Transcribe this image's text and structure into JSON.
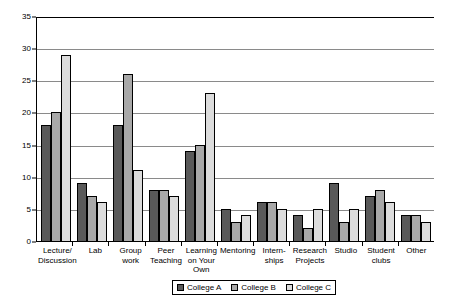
{
  "chart_data": {
    "type": "bar",
    "title": "",
    "subtitle": "",
    "xlabel": "",
    "ylabel": "",
    "ylim": [
      0,
      35
    ],
    "ytick_step": 5,
    "yticks": [
      "0",
      "5",
      "10",
      "15",
      "20",
      "25",
      "30",
      "35"
    ],
    "grid": true,
    "legend_position": "bottom",
    "categories": [
      "Lecture/\nDiscussion",
      "Lab",
      "Group\nwork",
      "Peer\nTeaching",
      "Learning\non Your\nOwn",
      "Mentoring",
      "Intern-\nships",
      "Research\nProjects",
      "Studio",
      "Student\nclubs",
      "Other"
    ],
    "series": [
      {
        "name": "College A",
        "color": "#595959",
        "values": [
          18,
          9,
          18,
          8,
          14,
          5,
          6,
          4,
          9,
          7,
          4
        ]
      },
      {
        "name": "College B",
        "color": "#a8a8a8",
        "values": [
          20,
          7,
          26,
          8,
          15,
          3,
          6,
          2,
          3,
          8,
          4
        ]
      },
      {
        "name": "College C",
        "color": "#dcdcdc",
        "values": [
          29,
          6,
          11,
          7,
          23,
          4,
          5,
          5,
          5,
          6,
          3
        ]
      }
    ]
  }
}
